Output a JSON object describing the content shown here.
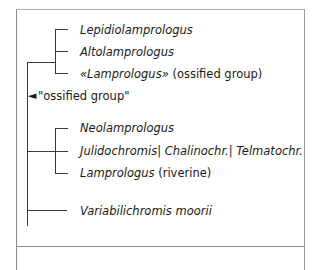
{
  "tree": {
    "clade_a": [
      {
        "name": "Lepidiolamprologus",
        "suffix": ""
      },
      {
        "name": "Altolamprologus",
        "suffix": ""
      },
      {
        "name": "«Lamprologus»",
        "suffix": " (ossified group)"
      }
    ],
    "marker": {
      "arrow": "◄",
      "label": "\"ossified group\""
    },
    "clade_b": [
      {
        "name": "Neolamprologus",
        "suffix": ""
      },
      {
        "name": "Julidochromis| Chalinochr.| Telmatochr.",
        "suffix": ""
      },
      {
        "name": "Lamprologus",
        "suffix": " (riverine)"
      }
    ],
    "outgroup": {
      "name": "Variabilichromis moorii",
      "suffix": ""
    }
  }
}
